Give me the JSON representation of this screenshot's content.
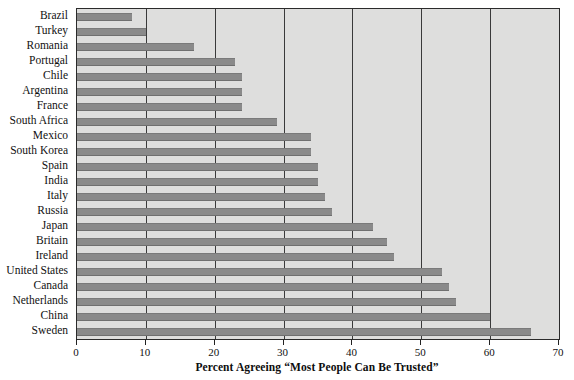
{
  "chart_data": {
    "type": "bar",
    "orientation": "horizontal",
    "title": "",
    "xlabel": "Percent Agreeing “Most People Can Be Trusted”",
    "ylabel": "",
    "xlim": [
      0,
      70
    ],
    "xticks": [
      0,
      10,
      20,
      30,
      40,
      50,
      60,
      70
    ],
    "xtick_labels": [
      "0",
      "10",
      "20",
      "30",
      "40",
      "50",
      "60",
      "70"
    ],
    "grid": "vertical",
    "legend": "none",
    "categories": [
      "Brazil",
      "Turkey",
      "Romania",
      "Portugal",
      "Chile",
      "Argentina",
      "France",
      "South Africa",
      "Mexico",
      "South Korea",
      "Spain",
      "India",
      "Italy",
      "Russia",
      "Japan",
      "Britain",
      "Ireland",
      "United States",
      "Canada",
      "Netherlands",
      "China",
      "Sweden"
    ],
    "values": [
      8,
      10,
      17,
      23,
      24,
      24,
      24,
      29,
      34,
      34,
      35,
      35,
      36,
      37,
      43,
      45,
      46,
      53,
      54,
      55,
      60,
      66
    ],
    "bar_color": "#8a8a8a",
    "plot_background_color": "#dededd",
    "frame_color": "#2b2b2b",
    "gridline_color": "#3a3a3a"
  }
}
